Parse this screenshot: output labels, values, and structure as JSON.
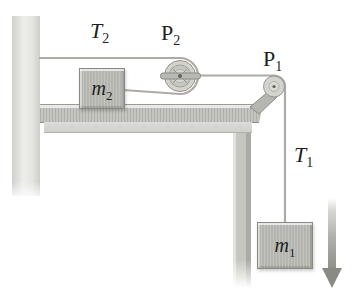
{
  "figure": {
    "type": "physics-pulley-diagram",
    "labels": {
      "tension2": {
        "base": "T",
        "sub": "2"
      },
      "pulley2": {
        "base": "P",
        "sub": "2"
      },
      "pulley1": {
        "base": "P",
        "sub": "1"
      },
      "tension1": {
        "base": "T",
        "sub": "1"
      },
      "mass2": {
        "base": "m",
        "sub": "2"
      },
      "mass1": {
        "base": "m",
        "sub": "1"
      }
    },
    "colors": {
      "background": "#ffffff",
      "string": "#aeaaa6",
      "block_fill": "#b5b5b0",
      "block_border": "#8a8a84",
      "arrow": "#8a8a85",
      "label_text": "#1f1f1f"
    }
  }
}
